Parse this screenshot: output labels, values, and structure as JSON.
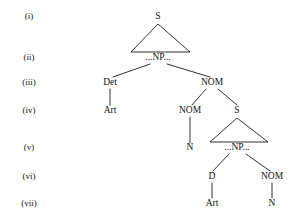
{
  "figure": {
    "type": "syntax-tree-diagram",
    "background_color": "#ffffff",
    "ink_color": "#1c1c1c",
    "width": 304,
    "height": 221
  },
  "row_labels": [
    {
      "id": "row-i",
      "text": "(i)",
      "x": 29,
      "y": 19
    },
    {
      "id": "row-ii",
      "text": "(ii)",
      "x": 29,
      "y": 60
    },
    {
      "id": "row-iii",
      "text": "(iii)",
      "x": 29,
      "y": 85
    },
    {
      "id": "row-iv",
      "text": "(iv)",
      "x": 29,
      "y": 113
    },
    {
      "id": "row-v",
      "text": "(v)",
      "x": 29,
      "y": 150
    },
    {
      "id": "row-vi",
      "text": "(vi)",
      "x": 29,
      "y": 179
    },
    {
      "id": "row-vii",
      "text": "(vii)",
      "x": 29,
      "y": 206
    }
  ],
  "nodes": [
    {
      "id": "n-s-top",
      "label": "S",
      "x": 158,
      "y": 19,
      "row": "(i)"
    },
    {
      "id": "n-np-top",
      "label": "...NP...",
      "x": 158,
      "y": 60,
      "row": "(ii)"
    },
    {
      "id": "n-det",
      "label": "Det",
      "x": 110,
      "y": 85,
      "row": "(iii)"
    },
    {
      "id": "n-nom-1",
      "label": "NOM",
      "x": 212,
      "y": 85,
      "row": "(iii)"
    },
    {
      "id": "n-art-1",
      "label": "Art",
      "x": 110,
      "y": 113,
      "row": "(iv)"
    },
    {
      "id": "n-nom-2",
      "label": "NOM",
      "x": 190,
      "y": 113,
      "row": "(iv)"
    },
    {
      "id": "n-s-lower",
      "label": "S",
      "x": 237,
      "y": 113,
      "row": "(iv)"
    },
    {
      "id": "n-n-1",
      "label": "N",
      "x": 190,
      "y": 150,
      "row": "(v)"
    },
    {
      "id": "n-np-lower",
      "label": "...NP...",
      "x": 237,
      "y": 150,
      "row": "(v)"
    },
    {
      "id": "n-d",
      "label": "D",
      "x": 212,
      "y": 179,
      "row": "(vi)"
    },
    {
      "id": "n-nom-3",
      "label": "NOM",
      "x": 272,
      "y": 179,
      "row": "(vi)"
    },
    {
      "id": "n-art-2",
      "label": "Art",
      "x": 212,
      "y": 206,
      "row": "(vii)"
    },
    {
      "id": "n-n-2",
      "label": "N",
      "x": 272,
      "y": 206,
      "row": "(vii)"
    }
  ],
  "edges": [
    {
      "id": "e-np-det",
      "from": "...NP...",
      "to": "Det",
      "x1": 150,
      "y1": 64,
      "x2": 113,
      "y2": 77
    },
    {
      "id": "e-np-nom1",
      "from": "...NP...",
      "to": "NOM",
      "x1": 167,
      "y1": 64,
      "x2": 210,
      "y2": 77
    },
    {
      "id": "e-det-art",
      "from": "Det",
      "to": "Art",
      "x1": 110,
      "y1": 89,
      "x2": 110,
      "y2": 105
    },
    {
      "id": "e-nom1-nom2",
      "from": "NOM",
      "to": "NOM",
      "x1": 206,
      "y1": 89,
      "x2": 192,
      "y2": 105
    },
    {
      "id": "e-nom1-s",
      "from": "NOM",
      "to": "S",
      "x1": 218,
      "y1": 89,
      "x2": 237,
      "y2": 105
    },
    {
      "id": "e-nom2-n1",
      "from": "NOM",
      "to": "N",
      "x1": 190,
      "y1": 117,
      "x2": 190,
      "y2": 143
    },
    {
      "id": "e-np2-d",
      "from": "...NP...",
      "to": "D",
      "x1": 229,
      "y1": 154,
      "x2": 213,
      "y2": 171
    },
    {
      "id": "e-np2-nom3",
      "from": "...NP...",
      "to": "NOM",
      "x1": 246,
      "y1": 154,
      "x2": 270,
      "y2": 171
    },
    {
      "id": "e-d-art2",
      "from": "D",
      "to": "Art",
      "x1": 212,
      "y1": 183,
      "x2": 212,
      "y2": 198
    },
    {
      "id": "e-nom3-n2",
      "from": "NOM",
      "to": "N",
      "x1": 272,
      "y1": 183,
      "x2": 272,
      "y2": 198
    }
  ],
  "triangles": [
    {
      "id": "tri-s-top",
      "dominates": "S",
      "spans": "...NP...",
      "apex_x": 158,
      "apex_y": 24,
      "left_x": 131,
      "left_y": 52,
      "right_x": 190,
      "right_y": 52
    },
    {
      "id": "tri-s-lower",
      "dominates": "S",
      "spans": "...NP...",
      "apex_x": 237,
      "apex_y": 118,
      "left_x": 210,
      "left_y": 142,
      "right_x": 268,
      "right_y": 142
    }
  ]
}
